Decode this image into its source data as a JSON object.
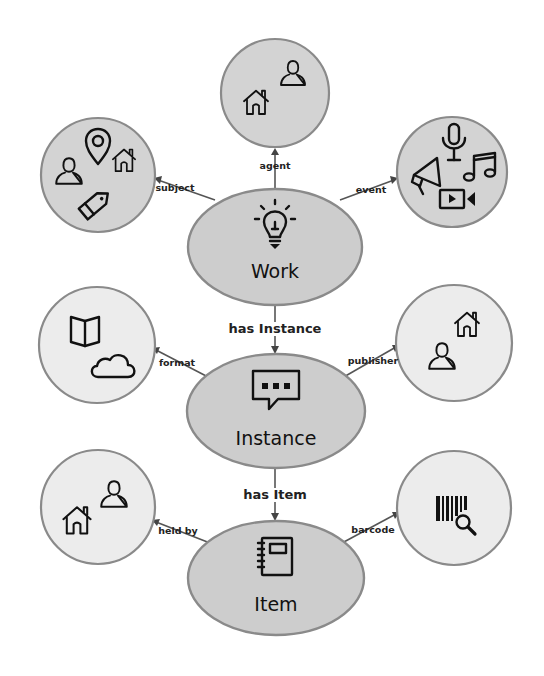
{
  "diagram": {
    "type": "entity-relationship",
    "colors": {
      "background": "#ffffff",
      "main_node_fill": "#cdcdcd",
      "top_circle_fill": "#d3d3d3",
      "side_circle_fill": "#ececec",
      "stroke": "#8a8a8a",
      "icon": "#111111"
    },
    "main_nodes": [
      {
        "id": "work",
        "label": "Work",
        "icon": "lightbulb-icon"
      },
      {
        "id": "instance",
        "label": "Instance",
        "icon": "speech-bubble-icon"
      },
      {
        "id": "item",
        "label": "Item",
        "icon": "notebook-icon"
      }
    ],
    "main_edges": [
      {
        "from": "work",
        "to": "instance",
        "label": "has Instance"
      },
      {
        "from": "instance",
        "to": "item",
        "label": "has Item"
      }
    ],
    "satellites": [
      {
        "attached_to": "work",
        "edge_label": "subject",
        "icons": [
          "person-icon",
          "map-pin-icon",
          "house-icon",
          "tag-icon"
        ]
      },
      {
        "attached_to": "work",
        "edge_label": "agent",
        "icons": [
          "house-icon",
          "person-icon"
        ]
      },
      {
        "attached_to": "work",
        "edge_label": "event",
        "icons": [
          "microphone-icon",
          "megaphone-icon",
          "music-note-icon",
          "video-camera-icon"
        ]
      },
      {
        "attached_to": "instance",
        "edge_label": "format",
        "icons": [
          "open-book-icon",
          "cloud-icon"
        ]
      },
      {
        "attached_to": "instance",
        "edge_label": "publisher",
        "icons": [
          "house-icon",
          "person-icon"
        ]
      },
      {
        "attached_to": "item",
        "edge_label": "held by",
        "icons": [
          "person-icon",
          "house-icon"
        ]
      },
      {
        "attached_to": "item",
        "edge_label": "barcode",
        "icons": [
          "barcode-search-icon"
        ]
      }
    ]
  }
}
